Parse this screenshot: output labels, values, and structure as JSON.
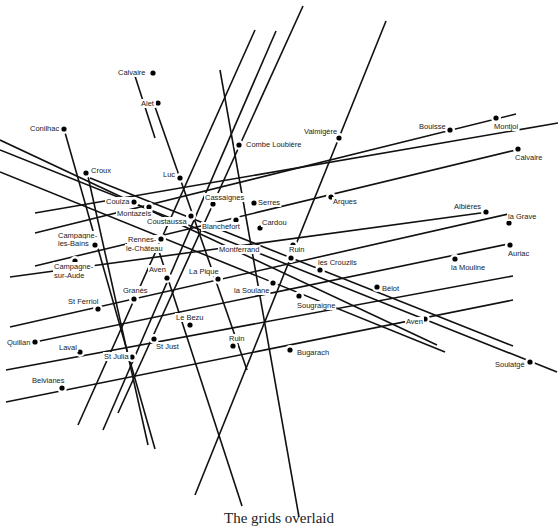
{
  "caption": "The grids overlaid",
  "colors": {
    "line": "#111111",
    "point": "#000000",
    "label": "#222222",
    "background": "#ffffff"
  },
  "lines": [
    {
      "x1": 303,
      "y1": 6,
      "x2": 118,
      "y2": 413
    },
    {
      "x1": 255,
      "y1": 30,
      "x2": 78,
      "y2": 425
    },
    {
      "x1": 276,
      "y1": 31,
      "x2": 103,
      "y2": 430
    },
    {
      "x1": 386,
      "y1": 21,
      "x2": 195,
      "y2": 495
    },
    {
      "x1": 134,
      "y1": 73,
      "x2": 155,
      "y2": 138
    },
    {
      "x1": 154,
      "y1": 104,
      "x2": 247,
      "y2": 370
    },
    {
      "x1": 220,
      "y1": 70,
      "x2": 299,
      "y2": 517
    },
    {
      "x1": 64,
      "y1": 129,
      "x2": 155,
      "y2": 449
    },
    {
      "x1": 87,
      "y1": 172,
      "x2": 148,
      "y2": 445
    },
    {
      "x1": 154,
      "y1": 236,
      "x2": 242,
      "y2": 506
    },
    {
      "x1": 0,
      "y1": 140,
      "x2": 437,
      "y2": 345
    },
    {
      "x1": 0,
      "y1": 150,
      "x2": 557,
      "y2": 372
    },
    {
      "x1": 90,
      "y1": 178,
      "x2": 513,
      "y2": 346
    },
    {
      "x1": 0,
      "y1": 172,
      "x2": 445,
      "y2": 352
    },
    {
      "x1": 35,
      "y1": 213,
      "x2": 558,
      "y2": 123
    },
    {
      "x1": 35,
      "y1": 233,
      "x2": 516,
      "y2": 114
    },
    {
      "x1": 35,
      "y1": 266,
      "x2": 516,
      "y2": 150
    },
    {
      "x1": 10,
      "y1": 277,
      "x2": 488,
      "y2": 212
    },
    {
      "x1": 10,
      "y1": 327,
      "x2": 513,
      "y2": 213
    },
    {
      "x1": 35,
      "y1": 342,
      "x2": 513,
      "y2": 243
    },
    {
      "x1": 6,
      "y1": 370,
      "x2": 513,
      "y2": 276
    },
    {
      "x1": 6,
      "y1": 402,
      "x2": 513,
      "y2": 300
    }
  ],
  "points": [
    {
      "name": "Calvaire",
      "x": 153,
      "y": 73,
      "lx": 118,
      "ly": 75,
      "anchor": "start"
    },
    {
      "name": "Alet",
      "x": 158,
      "y": 103,
      "lx": 141,
      "ly": 106,
      "anchor": "start"
    },
    {
      "name": "Conilhac",
      "x": 64,
      "y": 129,
      "lx": 30,
      "ly": 131,
      "anchor": "start"
    },
    {
      "name": "Combe Loubière",
      "x": 239,
      "y": 145,
      "lx": 246,
      "ly": 147,
      "anchor": "start"
    },
    {
      "name": "Valmigère",
      "x": 339,
      "y": 138,
      "lx": 304,
      "ly": 134,
      "anchor": "start"
    },
    {
      "name": "Bouisse",
      "x": 450,
      "y": 130,
      "lx": 419,
      "ly": 129,
      "anchor": "start"
    },
    {
      "name": "Montjoi",
      "x": 496,
      "y": 118,
      "lx": 494,
      "ly": 129,
      "anchor": "start"
    },
    {
      "name": "Calvaire",
      "x": 518,
      "y": 149,
      "lx": 515,
      "ly": 160,
      "anchor": "start"
    },
    {
      "name": "Croux",
      "x": 86,
      "y": 173,
      "lx": 91,
      "ly": 173,
      "anchor": "start"
    },
    {
      "name": "Luc",
      "x": 180,
      "y": 178,
      "lx": 163,
      "ly": 177,
      "anchor": "start"
    },
    {
      "name": "Cassaignes",
      "x": 213,
      "y": 204,
      "lx": 205,
      "ly": 200,
      "anchor": "start"
    },
    {
      "name": "Serres",
      "x": 254,
      "y": 203,
      "lx": 258,
      "ly": 205,
      "anchor": "start"
    },
    {
      "name": "Arques",
      "x": 331,
      "y": 197,
      "lx": 333,
      "ly": 204,
      "anchor": "start"
    },
    {
      "name": "Couiza",
      "x": 134,
      "y": 202,
      "lx": 106,
      "ly": 204,
      "anchor": "start"
    },
    {
      "name": "Montazels",
      "x": 149,
      "y": 207,
      "lx": 117,
      "ly": 216,
      "anchor": "start"
    },
    {
      "name": "Coustaussa",
      "x": 191,
      "y": 216,
      "lx": 147,
      "ly": 224,
      "anchor": "start"
    },
    {
      "name": "Blanchefort",
      "x": 236,
      "y": 220,
      "lx": 202,
      "ly": 229,
      "anchor": "start"
    },
    {
      "name": "Cardou",
      "x": 260,
      "y": 228,
      "lx": 262,
      "ly": 225,
      "anchor": "start"
    },
    {
      "name": "Albières",
      "x": 486,
      "y": 212,
      "lx": 454,
      "ly": 209,
      "anchor": "start"
    },
    {
      "name": "la Grave",
      "x": 509,
      "y": 223,
      "lx": 508,
      "ly": 219,
      "anchor": "start"
    },
    {
      "name": "Campagne-",
      "x": 95,
      "y": 245,
      "lx": 58,
      "ly": 238,
      "anchor": "start"
    },
    {
      "name": "les-Bains",
      "x": null,
      "y": null,
      "lx": 58,
      "ly": 246,
      "anchor": "start"
    },
    {
      "name": "Rennes-",
      "x": 161,
      "y": 239,
      "lx": 128,
      "ly": 242,
      "anchor": "start"
    },
    {
      "name": "le-Château",
      "x": null,
      "y": null,
      "lx": 126,
      "ly": 251,
      "anchor": "start"
    },
    {
      "name": "Montferrand",
      "x": 293,
      "y": 245,
      "lx": 219,
      "ly": 252,
      "anchor": "start"
    },
    {
      "name": "Ruin",
      "x": 291,
      "y": 258,
      "lx": 289,
      "ly": 252,
      "anchor": "start"
    },
    {
      "name": "Auriac",
      "x": 510,
      "y": 245,
      "lx": 508,
      "ly": 256,
      "anchor": "start"
    },
    {
      "name": "Campagne-",
      "x": 75,
      "y": 261,
      "lx": 54,
      "ly": 269,
      "anchor": "start"
    },
    {
      "name": "sur-Aude",
      "x": null,
      "y": null,
      "lx": 54,
      "ly": 278,
      "anchor": "start"
    },
    {
      "name": "les Crouzils",
      "x": 320,
      "y": 270,
      "lx": 318,
      "ly": 265,
      "anchor": "start"
    },
    {
      "name": "la Mouline",
      "x": 455,
      "y": 259,
      "lx": 451,
      "ly": 270,
      "anchor": "start"
    },
    {
      "name": "Aven",
      "x": 167,
      "y": 278,
      "lx": 149,
      "ly": 272,
      "anchor": "start"
    },
    {
      "name": "La Pique",
      "x": 218,
      "y": 279,
      "lx": 189,
      "ly": 274,
      "anchor": "start"
    },
    {
      "name": "la Soulane",
      "x": 273,
      "y": 283,
      "lx": 234,
      "ly": 293,
      "anchor": "start"
    },
    {
      "name": "Bélot",
      "x": 377,
      "y": 287,
      "lx": 382,
      "ly": 291,
      "anchor": "start"
    },
    {
      "name": "Granès",
      "x": 134,
      "y": 299,
      "lx": 123,
      "ly": 293,
      "anchor": "start"
    },
    {
      "name": "Sougraigne",
      "x": 299,
      "y": 296,
      "lx": 297,
      "ly": 308,
      "anchor": "start"
    },
    {
      "name": "St Ferriol",
      "x": 98,
      "y": 309,
      "lx": 68,
      "ly": 304,
      "anchor": "start"
    },
    {
      "name": "Aven",
      "x": 425,
      "y": 319,
      "lx": 406,
      "ly": 324,
      "anchor": "start"
    },
    {
      "name": "Le Bezu",
      "x": 190,
      "y": 325,
      "lx": 176,
      "ly": 320,
      "anchor": "start"
    },
    {
      "name": "Quillan",
      "x": 35,
      "y": 342,
      "lx": 7,
      "ly": 345,
      "anchor": "start"
    },
    {
      "name": "St Just",
      "x": 154,
      "y": 339,
      "lx": 156,
      "ly": 349,
      "anchor": "start"
    },
    {
      "name": "Ruin",
      "x": 233,
      "y": 346,
      "lx": 229,
      "ly": 341,
      "anchor": "start"
    },
    {
      "name": "Laval",
      "x": 80,
      "y": 352,
      "lx": 59,
      "ly": 350,
      "anchor": "start"
    },
    {
      "name": "Bugarach",
      "x": 290,
      "y": 350,
      "lx": 297,
      "ly": 355,
      "anchor": "start"
    },
    {
      "name": "St Julia",
      "x": 132,
      "y": 357,
      "lx": 104,
      "ly": 359,
      "anchor": "start"
    },
    {
      "name": "Soulatgé",
      "x": 530,
      "y": 362,
      "lx": 495,
      "ly": 367,
      "anchor": "start"
    },
    {
      "name": "Belvianes",
      "x": 62,
      "y": 388,
      "lx": 32,
      "ly": 383,
      "anchor": "start"
    }
  ]
}
